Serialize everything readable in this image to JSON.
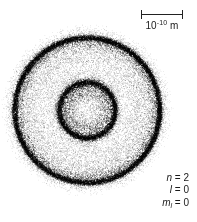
{
  "figure": {
    "title": "",
    "background_color": "#ffffff",
    "ink_color": "#1a1a1a"
  },
  "scale_bar": {
    "name": "scale-bar",
    "value": "10",
    "exponent": "-10",
    "unit": "m",
    "label_full": "10-10 m",
    "length_px": 42
  },
  "quantum_numbers": {
    "principal": {
      "symbol": "n",
      "equals": "=",
      "value": "2"
    },
    "orbital": {
      "symbol": "l",
      "equals": "=",
      "value": "0"
    },
    "magnetic": {
      "symbol": "m",
      "subscript": "l",
      "equals": "=",
      "value": "0"
    }
  },
  "chart_data": {
    "type": "scatter",
    "title": "",
    "subtitle": "",
    "xlabel": "",
    "ylabel": "",
    "center": {
      "x": 87,
      "y": 110
    },
    "dot_color": "#000000",
    "dot_count": 26000,
    "radial_profile": {
      "r_units": "pixels",
      "r": [
        0,
        4,
        8,
        12,
        16,
        20,
        24,
        27,
        28,
        29,
        32,
        36,
        40,
        44,
        48,
        52,
        56,
        60,
        64,
        68,
        70,
        72,
        73,
        74,
        76,
        80,
        84,
        88
      ],
      "density": [
        0.3,
        0.34,
        0.4,
        0.48,
        0.55,
        0.62,
        0.8,
        1.0,
        1.0,
        0.95,
        0.52,
        0.3,
        0.27,
        0.28,
        0.3,
        0.33,
        0.37,
        0.42,
        0.5,
        0.68,
        0.85,
        1.0,
        1.0,
        0.9,
        0.45,
        0.16,
        0.05,
        0.0
      ]
    },
    "rings": [
      {
        "name": "inner-shell-ring",
        "radius": 28,
        "peak_density": 1.0,
        "sharpness": 2.6
      },
      {
        "name": "outer-shell-ring",
        "radius": 72.5,
        "peak_density": 1.0,
        "sharpness": 2.8
      }
    ],
    "node": {
      "name": "radial-node",
      "radius": 40,
      "density": 0.26
    },
    "outer_cutoff_radius": 86,
    "axis_ranges": {
      "xlim": [
        0,
        197
      ],
      "ylim": [
        0,
        222
      ]
    },
    "grid": false,
    "legend": false
  }
}
